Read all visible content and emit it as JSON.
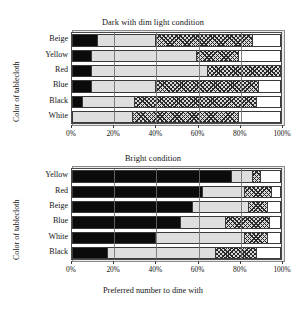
{
  "figure": {
    "xlabel": "Preferred number to dine with",
    "ylabel_top": "Color of tablecloth",
    "ylabel_bottom": "Color of tablecloth",
    "tick_labels": [
      "0%",
      "20%",
      "40%",
      "60%",
      "80%",
      "100%"
    ],
    "tick_values": [
      0,
      20,
      40,
      60,
      80,
      100
    ]
  },
  "chart_data": [
    {
      "type": "bar",
      "orientation": "horizontal",
      "stacked": true,
      "normalized_percent": true,
      "title": "Dark with dim light condition",
      "xlabel": "Preferred number to dine with",
      "ylabel": "Color of tablecloth",
      "xlim": [
        0,
        100
      ],
      "xticks": [
        0,
        20,
        40,
        60,
        80,
        100
      ],
      "xticklabels": [
        "0%",
        "20%",
        "40%",
        "60%",
        "80%",
        "100%"
      ],
      "grid": true,
      "legend": "none",
      "categories": [
        "Beige",
        "Yellow",
        "Red",
        "Blue",
        "Black",
        "White"
      ],
      "series": [
        {
          "name": "segment-1-black",
          "fill": "solid-black",
          "values": [
            12,
            9,
            9,
            9,
            5,
            0
          ]
        },
        {
          "name": "segment-2-light-gray",
          "fill": "light-gray",
          "values": [
            28,
            51,
            56,
            31,
            25,
            29
          ]
        },
        {
          "name": "segment-3-cross-hatch",
          "fill": "cross-hatch",
          "values": [
            47,
            20,
            35,
            50,
            59,
            51
          ]
        },
        {
          "name": "segment-4-white",
          "fill": "white",
          "values": [
            13,
            20,
            0,
            10,
            11,
            20
          ]
        }
      ],
      "cumulative_edges": [
        [
          12,
          40,
          87,
          100
        ],
        [
          9,
          60,
          80,
          100
        ],
        [
          9,
          65,
          100,
          100
        ],
        [
          9,
          40,
          90,
          100
        ],
        [
          5,
          30,
          89,
          100
        ],
        [
          0,
          29,
          80,
          100
        ]
      ]
    },
    {
      "type": "bar",
      "orientation": "horizontal",
      "stacked": true,
      "normalized_percent": true,
      "title": "Bright condition",
      "xlabel": "Preferred number to dine with",
      "ylabel": "Color of tablecloth",
      "xlim": [
        0,
        100
      ],
      "xticks": [
        0,
        20,
        40,
        60,
        80,
        100
      ],
      "xticklabels": [
        "0%",
        "20%",
        "40%",
        "60%",
        "80%",
        "100%"
      ],
      "grid": true,
      "legend": "none",
      "categories": [
        "Yellow",
        "Red",
        "Beige",
        "Blue",
        "White",
        "Black"
      ],
      "series": [
        {
          "name": "segment-1-black",
          "fill": "solid-black",
          "values": [
            77,
            63,
            58,
            52,
            40,
            17
          ]
        },
        {
          "name": "segment-2-light-gray",
          "fill": "light-gray",
          "values": [
            10,
            20,
            27,
            22,
            43,
            52
          ]
        },
        {
          "name": "segment-3-cross-hatch",
          "fill": "cross-hatch",
          "values": [
            4,
            13,
            9,
            21,
            11,
            20
          ]
        },
        {
          "name": "segment-4-white",
          "fill": "white",
          "values": [
            9,
            4,
            6,
            5,
            6,
            11
          ]
        }
      ],
      "cumulative_edges": [
        [
          77,
          87,
          91,
          100
        ],
        [
          63,
          83,
          96,
          100
        ],
        [
          58,
          85,
          94,
          100
        ],
        [
          52,
          74,
          95,
          100
        ],
        [
          40,
          83,
          94,
          100
        ],
        [
          17,
          69,
          89,
          100
        ]
      ]
    }
  ]
}
